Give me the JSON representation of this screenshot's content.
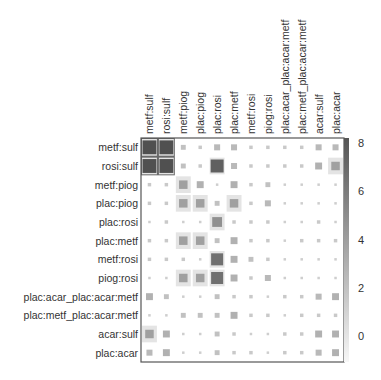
{
  "chart_data": {
    "type": "heatmap",
    "style": "corrplot-squares",
    "title": "",
    "xlabel": "",
    "ylabel": "",
    "labels": [
      "metf:sulf",
      "rosi:sulf",
      "metf:piog",
      "plac:piog",
      "plac:rosi",
      "plac:metf",
      "metf:rosi",
      "piog:rosi",
      "plac:acar_plac:acar:metf",
      "plac:metf_plac:acar:metf",
      "acar:sulf",
      "plac:acar"
    ],
    "rows": [
      "metf:sulf",
      "rosi:sulf",
      "metf:piog",
      "plac:piog",
      "plac:rosi",
      "plac:metf",
      "metf:rosi",
      "piog:rosi",
      "plac:acar_plac:acar:metf",
      "plac:metf_plac:acar:metf",
      "acar:sulf",
      "plac:acar"
    ],
    "columns": [
      "metf:sulf",
      "rosi:sulf",
      "metf:piog",
      "plac:piog",
      "plac:rosi",
      "plac:metf",
      "metf:rosi",
      "piog:rosi",
      "plac:acar_plac:acar:metf",
      "plac:metf_plac:acar:metf",
      "acar:sulf",
      "plac:acar"
    ],
    "values": [
      [
        8,
        8,
        1,
        0.5,
        1.5,
        1.5,
        0.5,
        0.5,
        0.5,
        0.5,
        1.5,
        1.5
      ],
      [
        8,
        8,
        1,
        0.5,
        7,
        1.5,
        0.5,
        0.5,
        0.5,
        0.5,
        2,
        3
      ],
      [
        0.5,
        0.5,
        3,
        2,
        0.2,
        2,
        0.5,
        1,
        0.2,
        0.2,
        0.2,
        0.2
      ],
      [
        0.5,
        0.5,
        3,
        3,
        1,
        3,
        0.5,
        1.5,
        0.2,
        0.2,
        0.2,
        0.2
      ],
      [
        0.2,
        0.5,
        0.1,
        0.2,
        4,
        0.5,
        0.5,
        0.5,
        0.1,
        0.2,
        0.5,
        0.2
      ],
      [
        0.5,
        0.5,
        3,
        3,
        1,
        2,
        0.5,
        0.5,
        0.2,
        0.5,
        0.5,
        0.5
      ],
      [
        0.5,
        0.5,
        0.5,
        0.2,
        6,
        2,
        1,
        0.5,
        0.2,
        0.2,
        0.2,
        0.2
      ],
      [
        0.2,
        0.2,
        3,
        3,
        6,
        2,
        0.5,
        1.5,
        0.2,
        0.2,
        0.1,
        0.2
      ],
      [
        2,
        1,
        0.2,
        0.2,
        1,
        0.5,
        0.5,
        0.2,
        0.5,
        0.5,
        1.5,
        2
      ],
      [
        0.2,
        0.2,
        1,
        1,
        1,
        2,
        0.5,
        0.5,
        0.2,
        0.5,
        0.5,
        0.5
      ],
      [
        3,
        2,
        0.2,
        0.2,
        1,
        0.5,
        0.2,
        0.2,
        0.5,
        0.5,
        2,
        2
      ],
      [
        1.5,
        2,
        0.2,
        0.2,
        1,
        0.5,
        0.5,
        0.2,
        0.5,
        0.5,
        1.5,
        2
      ]
    ],
    "highlight_blocks": [
      {
        "rows": [
          0,
          1
        ],
        "cols": [
          0,
          1
        ]
      }
    ],
    "colorbar": {
      "ticks": [
        8,
        6,
        4,
        2,
        0
      ],
      "range": [
        -1,
        8.3
      ],
      "color_high": "#555555",
      "color_low": "#f4f4f4",
      "position": "right"
    },
    "grid": false,
    "legend_position": "right"
  },
  "colors": {
    "cell_high": "#555555",
    "cell_low": "#cfcfcf",
    "frame": "#555555",
    "text": "#333333"
  }
}
